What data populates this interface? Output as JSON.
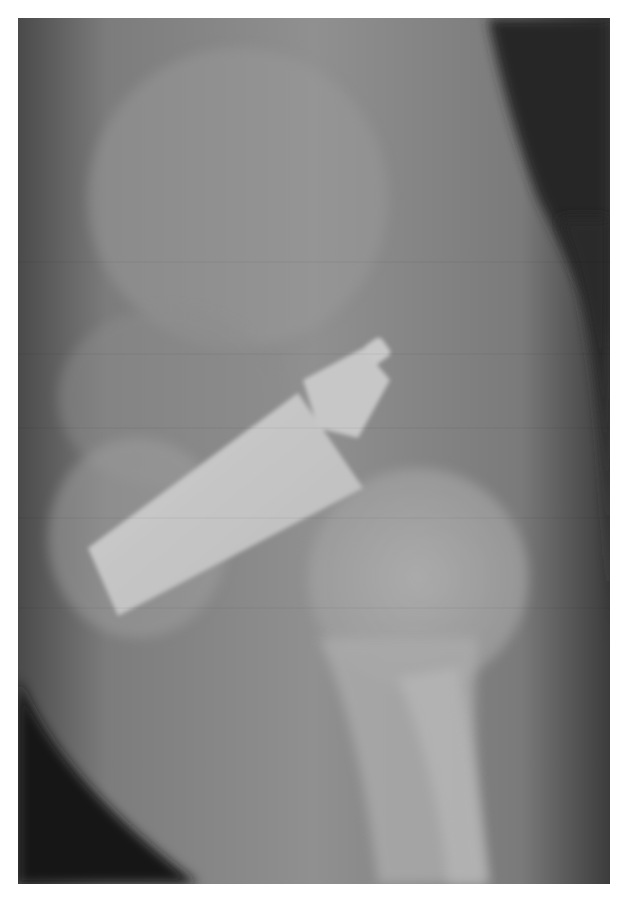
{
  "image": {
    "kind": "radiograph",
    "view": "lateral pelvis / hip",
    "subject": "cylindrical radiopaque foreign object (bottle-shaped) projected over the pelvis",
    "colors": {
      "background": "#ffffff",
      "soft_tissue": "#8a8a8a",
      "dark_air": "#1e1e1e",
      "bone": "#b0b0b0",
      "object": "#c4c4c4"
    }
  }
}
